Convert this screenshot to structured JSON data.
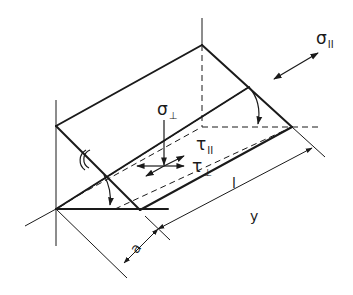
{
  "diagram": {
    "stroke_color": "#1a1a1a",
    "background": "#ffffff",
    "labels": {
      "sigma_parallel": {
        "symbol": "σ",
        "subscript": "II"
      },
      "sigma_perp": {
        "symbol": "σ",
        "subscript": "⊥"
      },
      "tau_parallel": {
        "symbol": "τ",
        "subscript": "II"
      },
      "tau_perp": {
        "symbol": "τ",
        "subscript": "⊥"
      },
      "length": "l",
      "y_dim": "y",
      "throat": "a"
    }
  }
}
